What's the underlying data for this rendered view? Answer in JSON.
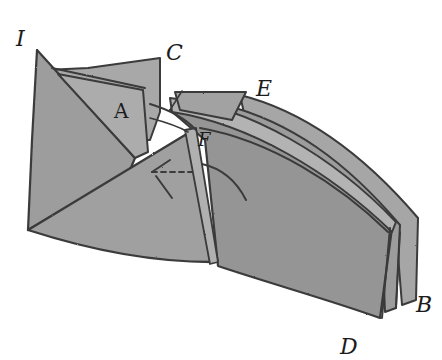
{
  "figure": {
    "labels": {
      "I": "I",
      "C": "C",
      "A": "A",
      "E": "E",
      "F": "F",
      "D": "D",
      "B": "B"
    },
    "colors": {
      "paper_fill": "#9a9a9a",
      "paper_light": "#b4b4b4",
      "paper_dark": "#868686",
      "ink": "#3a3a3a",
      "label": "#1c1c1c",
      "background": "#ffffff"
    }
  }
}
